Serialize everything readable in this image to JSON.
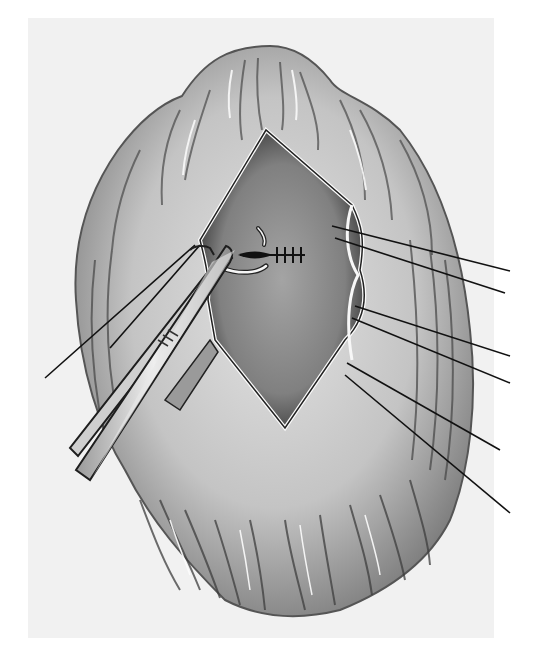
{
  "image": {
    "kind": "surgical-illustration",
    "style": "grayscale-pencil",
    "subject": "incision-closure-with-retraction-sutures",
    "elements": {
      "tissue": "tissue-mass",
      "incision": "diamond-shaped-opening",
      "instrument": "forceps",
      "needle": "curved-needle",
      "suture_line": "running-sutures",
      "retraction_sutures_right": 6,
      "retraction_sutures_left": 1
    },
    "colors": {
      "background": "#ffffff",
      "paper": "#f2f2f2",
      "tissue_light": "#d8d8d8",
      "tissue_mid": "#a8a8a8",
      "tissue_dark": "#555555",
      "cavity": "#8e8e8e",
      "line": "#1a1a1a",
      "highlight": "#fafafa"
    }
  }
}
